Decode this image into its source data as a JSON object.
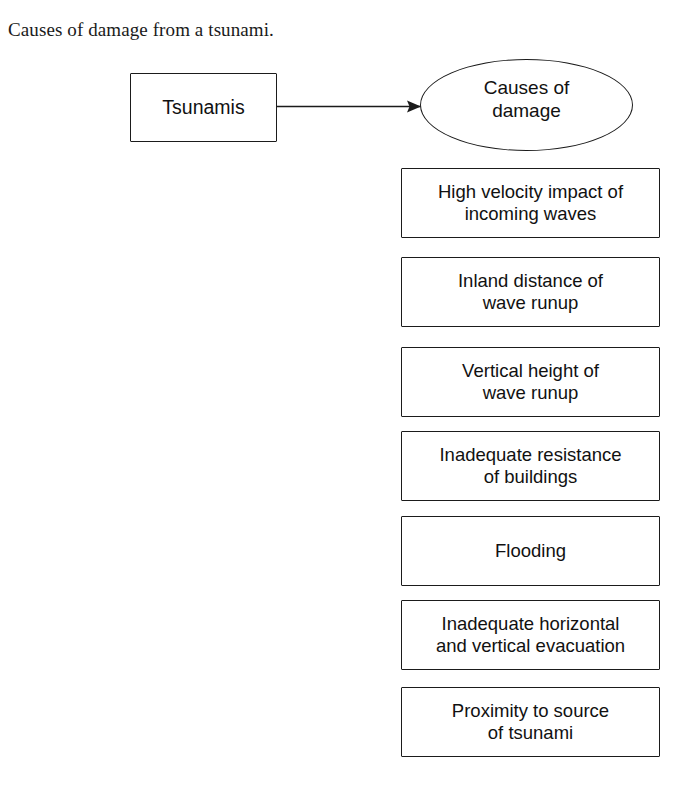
{
  "caption": "Causes of damage from a tsunami.",
  "diagram": {
    "type": "flow-diagram",
    "source_node": {
      "shape": "rectangle",
      "label": "Tsunamis"
    },
    "hub_node": {
      "shape": "ellipse",
      "label": "Causes of\ndamage"
    },
    "connector": {
      "style": "solid-line-with-arrowhead",
      "from": "Tsunamis",
      "to": "Causes of damage"
    },
    "causes": [
      {
        "label": "High velocity impact of\nincoming waves"
      },
      {
        "label": "Inland distance of\nwave runup"
      },
      {
        "label": "Vertical height of\nwave runup"
      },
      {
        "label": "Inadequate resistance\nof buildings"
      },
      {
        "label": "Flooding"
      },
      {
        "label": "Inadequate horizontal\nand vertical evacuation"
      },
      {
        "label": "Proximity to source\nof tsunami"
      }
    ]
  },
  "colors": {
    "background": "#ffffff",
    "stroke": "#1b1b1b",
    "text": "#111111"
  }
}
